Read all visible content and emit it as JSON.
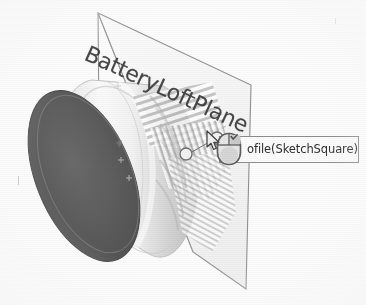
{
  "app": {
    "view_type": "cad-3d-viewport",
    "background_color": "#fcfcfc"
  },
  "scene": {
    "plane": {
      "label": "BatteryLoftPlane",
      "label_rotation_deg": 24.5,
      "outline_color": "#8a8a8a",
      "fill_color": "#f4f4f4"
    },
    "body": {
      "name": "loft-cylinder",
      "front_face_color": "#5c5c5c",
      "side_face_color": "#efefef",
      "edge_color": "#d8d8d8"
    },
    "handles": [
      {
        "name": "sketch-point-left"
      },
      {
        "name": "sketch-point-right"
      }
    ]
  },
  "tooltip": {
    "name": "profile-tooltip",
    "full_text": "Profile(SketchSquare)",
    "occluded_prefix": "Pr",
    "visible_text": "ofile(SketchSquare)",
    "border_color": "#8d8d8d",
    "background_color": "#fbfbfb"
  },
  "cursor": {
    "icon": "mouse-icon",
    "pointer": "arrow-cursor-icon"
  }
}
